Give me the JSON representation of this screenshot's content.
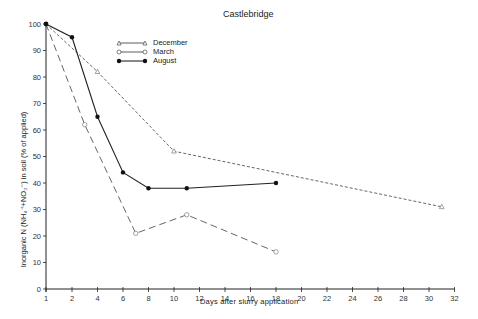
{
  "chart_data": {
    "type": "line",
    "title": "Castlebridge",
    "xlabel": "Days after slurry application",
    "ylabel": "Inorganic N (NH4+ + NO3-) in soil (% of applied)",
    "xlim": [
      1,
      32
    ],
    "ylim": [
      0,
      100
    ],
    "x_ticks": [
      1,
      2,
      4,
      6,
      8,
      10,
      12,
      14,
      16,
      18,
      20,
      22,
      24,
      26,
      28,
      30,
      32
    ],
    "y_ticks": [
      0,
      10,
      20,
      30,
      40,
      50,
      60,
      70,
      80,
      90,
      100
    ],
    "grid": false,
    "legend_position": "upper-left-inside",
    "series": [
      {
        "name": "December",
        "marker": "open-triangle",
        "line_style": "short-dash",
        "x": [
          1,
          4,
          10,
          31
        ],
        "y": [
          100,
          82,
          52,
          31
        ]
      },
      {
        "name": "March",
        "marker": "open-circle",
        "line_style": "long-dash",
        "x": [
          1,
          3,
          7,
          11,
          18
        ],
        "y": [
          100,
          62,
          21,
          28,
          14
        ]
      },
      {
        "name": "August",
        "marker": "filled-circle",
        "line_style": "solid",
        "x": [
          1,
          2,
          4,
          6,
          8,
          11,
          18
        ],
        "y": [
          100,
          95,
          65,
          44,
          38,
          38,
          40
        ]
      }
    ]
  },
  "labels": {
    "title": "Castlebridge",
    "xlabel": "Days after slurry application",
    "ylabel": "Inorganic N (NH₄⁺+NO₃⁻) in soil (% of applied)",
    "legend": [
      "December",
      "March",
      "August"
    ]
  }
}
